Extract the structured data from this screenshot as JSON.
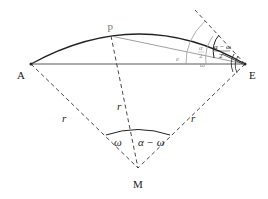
{
  "diagram": {
    "points": {
      "A": {
        "label": "A",
        "x": 31,
        "y": 64
      },
      "E": {
        "label": "E",
        "x": 245,
        "y": 64
      },
      "P": {
        "label": "P",
        "x": 111,
        "y": 36
      },
      "M": {
        "label": "M",
        "x": 138,
        "y": 168
      }
    },
    "radius_labels": [
      "r",
      "r",
      "r"
    ],
    "center_angles": {
      "left": "ω",
      "right": "α − ω"
    },
    "edge_labels": {
      "chord_PE": "e"
    },
    "angle_labels_at_E": {
      "half_alpha_num": "α",
      "half_alpha_den": "2",
      "omega": "ω",
      "half_diff_num": "α − ω",
      "half_diff_den": "2"
    },
    "colors": {
      "line": "#222222",
      "gray": "#8a8a8a",
      "dash": "#333333"
    }
  }
}
